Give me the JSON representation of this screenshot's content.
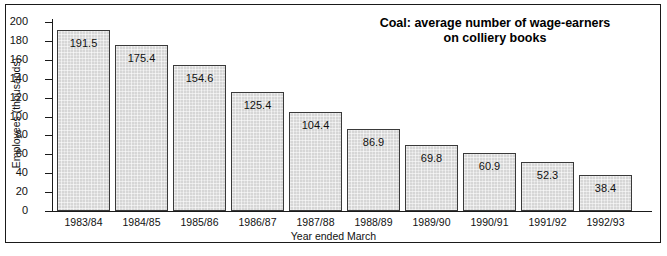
{
  "chart_data": {
    "type": "bar",
    "title": "Coal: average number of wage-earners on colliery books",
    "title_line1": "Coal: average number of wage-earners",
    "title_line2": "on colliery books",
    "xlabel": "Year ended March",
    "ylabel": "Employees (thousands)",
    "ylim": [
      0,
      200
    ],
    "ytick_step": 20,
    "grid": false,
    "legend": null,
    "categories": [
      "1983/84",
      "1984/85",
      "1985/86",
      "1986/87",
      "1987/88",
      "1988/89",
      "1989/90",
      "1990/91",
      "1991/92",
      "1992/93"
    ],
    "values": [
      191.5,
      175.4,
      154.6,
      125.4,
      104.4,
      86.9,
      69.8,
      60.9,
      52.3,
      38.4
    ],
    "value_labels": [
      "191.5",
      "175.4",
      "154.6",
      "125.4",
      "104.4",
      "86.9",
      "69.8",
      "60.9",
      "52.3",
      "38.4"
    ],
    "ytick_labels": [
      "200",
      "180",
      "160",
      "140",
      "120",
      "100",
      "80",
      "60",
      "40",
      "20",
      "0"
    ],
    "ytick_values": [
      200,
      180,
      160,
      140,
      120,
      100,
      80,
      60,
      40,
      20,
      0
    ],
    "colors": {
      "bar_fill": "#d6d6d6",
      "bar_border": "#3a3a3a",
      "axis": "#1a1a1a",
      "text": "#111111",
      "background": "#ffffff",
      "frame": "#1a1a1a"
    }
  }
}
